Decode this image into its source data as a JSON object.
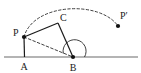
{
  "figure": {
    "type": "geometry-diagram",
    "width": 141,
    "height": 73,
    "background_color": "#ffffff",
    "stroke_color": "#1a1a1a",
    "baseline_color": "#6b6b6b"
  },
  "labels": {
    "p": "P",
    "p_prime": "P′",
    "c": "C",
    "a": "A",
    "b": "B"
  },
  "points": {
    "P": {
      "label": "P",
      "x": 24,
      "y": 37,
      "dot": true,
      "label_x": 15,
      "label_y": 34
    },
    "C": {
      "label": "C",
      "x": 58,
      "y": 23,
      "dot": false,
      "label_x": 61,
      "label_y": 20
    },
    "A": {
      "label": "A",
      "x": 24,
      "y": 57,
      "dot": false,
      "label_x": 20,
      "label_y": 69
    },
    "B": {
      "label": "B",
      "x": 73,
      "y": 57,
      "dot": true,
      "label_x": 69,
      "label_y": 70
    },
    "Pp": {
      "label": "P′",
      "x": 118,
      "y": 26,
      "dot": true,
      "label_x": 121,
      "label_y": 18
    }
  },
  "segments": [
    {
      "name": "segment-PA",
      "from": "P",
      "to": "A",
      "style": "solid"
    },
    {
      "name": "segment-PC",
      "from": "P",
      "to": "C",
      "style": "solid"
    },
    {
      "name": "segment-CB",
      "from": "C",
      "to": "B",
      "style": "solid"
    },
    {
      "name": "segment-PB",
      "from": "P",
      "to": "B",
      "style": "dashed"
    }
  ],
  "baseline": {
    "name": "baseline-AB-extended",
    "x1": 4,
    "y1": 57,
    "x2": 138,
    "y2": 57,
    "style": "solid"
  },
  "arcs": [
    {
      "name": "rotation-arc-P-to-Pprime",
      "style": "dashed",
      "from": "P",
      "to": "P′",
      "path": "M 24 37 C 34 2, 100 0, 118 26"
    },
    {
      "name": "angle-arc-at-B",
      "style": "solid",
      "vertex": "B",
      "path": "M 62 53 A 12 12 0 1 1 85 57"
    }
  ]
}
